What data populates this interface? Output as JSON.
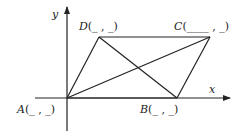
{
  "diagram": {
    "type": "parallelogram-on-coordinate-plane",
    "axes": {
      "x_label": "x",
      "y_label": "y"
    },
    "points": [
      {
        "id": "A",
        "name": "A",
        "coord_text": "(_ , _)",
        "px": [
          67,
          98
        ]
      },
      {
        "id": "B",
        "name": "B",
        "coord_text": "(_ , _)",
        "px": [
          177,
          98
        ]
      },
      {
        "id": "C",
        "name": "C",
        "coord_text": "(____ , _)",
        "px": [
          210,
          37
        ]
      },
      {
        "id": "D",
        "name": "D",
        "coord_text": "(_ , _)",
        "px": [
          99,
          37
        ]
      }
    ],
    "edges": [
      [
        "A",
        "B"
      ],
      [
        "B",
        "C"
      ],
      [
        "C",
        "D"
      ],
      [
        "D",
        "A"
      ]
    ],
    "diagonals": [
      [
        "A",
        "C"
      ],
      [
        "B",
        "D"
      ]
    ],
    "line_color": "#222222"
  }
}
